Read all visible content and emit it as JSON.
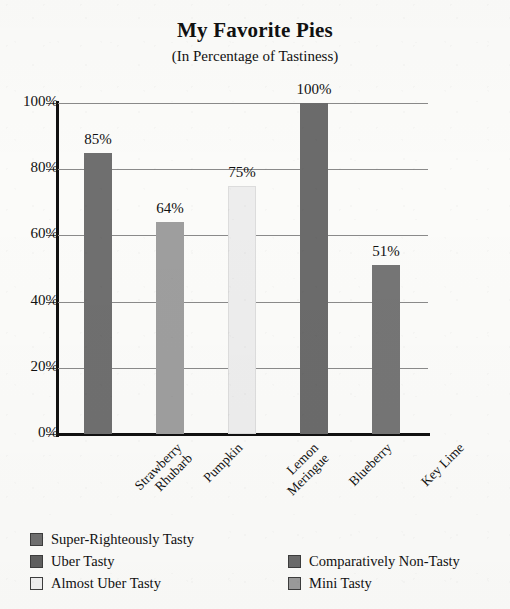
{
  "chart_data": {
    "type": "bar",
    "title": "My Favorite Pies",
    "subtitle": "(In Percentage of Tastiness)",
    "xlabel": "",
    "ylabel": "",
    "ylim": [
      0,
      100
    ],
    "grid": true,
    "legend_position": "bottom",
    "categories": [
      "Strawberry Rhubarb",
      "Pumpkin",
      "Lemon Meringue",
      "Blueberry",
      "Key Lime"
    ],
    "values": [
      85,
      64,
      75,
      100,
      51
    ],
    "value_labels": [
      "85%",
      "64%",
      "75%",
      "100%",
      "51%"
    ],
    "ytick_labels": [
      "0%",
      "20%",
      "40%",
      "60%",
      "80%",
      "100%"
    ],
    "ytick_values": [
      0,
      20,
      40,
      60,
      80,
      100
    ],
    "bar_colors": [
      "#6f6f6f",
      "#9e9e9e",
      "#ededed",
      "#6b6b6b",
      "#757575"
    ],
    "series_names": [
      "Super-Righteously Tasty",
      "Uber Tasty",
      "Almost Uber Tasty",
      "Comparatively Non-Tasty",
      "Mini Tasty"
    ]
  },
  "xaxis": {
    "labels": [
      {
        "line1": "Strawberry",
        "line2": "Rhubarb"
      },
      {
        "line1": "Pumpkin",
        "line2": ""
      },
      {
        "line1": "Lemon",
        "line2": "Meringue"
      },
      {
        "line1": "Blueberry",
        "line2": ""
      },
      {
        "line1": "Key Lime",
        "line2": ""
      }
    ]
  },
  "legend": {
    "left_column": [
      {
        "label": "Super-Righteously Tasty",
        "color": "#6f6f6f"
      },
      {
        "label": "Uber Tasty",
        "color": "#5f5f5f"
      },
      {
        "label": "Almost Uber Tasty",
        "color": "#eeeeee"
      }
    ],
    "right_column": [
      {
        "label": "Comparatively Non-Tasty",
        "color": "#6b6b6b"
      },
      {
        "label": "Mini Tasty",
        "color": "#9b9b9b"
      }
    ]
  }
}
